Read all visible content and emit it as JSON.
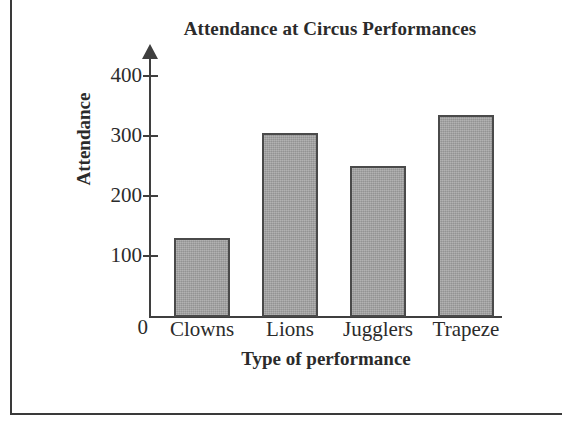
{
  "figure": {
    "title": "Attendance at Circus Performances",
    "y_axis_title": "Attendance",
    "x_axis_title": "Type of performance",
    "origin_label": "0",
    "bar_fill_color": "#a2a2a2",
    "bar_outline_color": "#4a4a4a",
    "axis_color": "#3f3f3f",
    "background_color": "#ffffff"
  },
  "chart_data": {
    "type": "bar",
    "title": "Attendance at Circus Performances",
    "xlabel": "Type of performance",
    "ylabel": "Attendance",
    "categories": [
      "Clowns",
      "Lions",
      "Jugglers",
      "Trapeze"
    ],
    "values": [
      130,
      305,
      250,
      335
    ],
    "ylim": [
      0,
      430
    ],
    "ytick_labels": [
      "400",
      "300",
      "200",
      "100",
      "0"
    ],
    "ytick_values": [
      400,
      300,
      200,
      100,
      0
    ],
    "grid": false,
    "legend": null,
    "bars": [
      {
        "category": "Clowns",
        "value": 130,
        "label": "Clowns"
      },
      {
        "category": "Lions",
        "value": 305,
        "label": "Lions"
      },
      {
        "category": "Jugglers",
        "value": 250,
        "label": "Jugglers"
      },
      {
        "category": "Trapeze",
        "value": 335,
        "label": "Trapeze"
      }
    ]
  }
}
